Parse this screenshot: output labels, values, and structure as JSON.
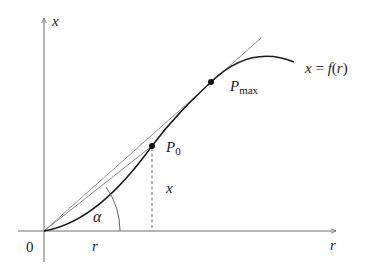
{
  "diagram": {
    "title": "",
    "axes": {
      "y_label": "x",
      "x_label": "r",
      "origin_label": "0"
    },
    "curve": {
      "label_lhs": "x",
      "label_eq": "=",
      "label_f": "f",
      "label_paren_open": "(",
      "label_arg": "r",
      "label_paren_close": ")"
    },
    "points": [
      {
        "name": "P",
        "subscript": "0"
      },
      {
        "name": "P",
        "subscript": "max"
      }
    ],
    "annotations": {
      "angle": "α",
      "horizontal_segment": "r",
      "vertical_segment": "x"
    },
    "colors": {
      "axis": "#6e6e6e",
      "curve": "#1a1a1a",
      "tangent": "#8a8a8a",
      "text": "#1a1a1a"
    }
  }
}
